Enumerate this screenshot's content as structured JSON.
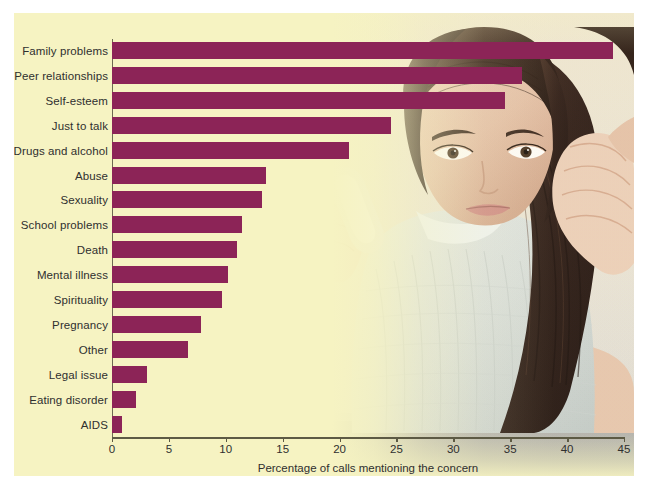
{
  "figure": {
    "background_color": "#f6f3c2",
    "border_color": "#ffffff",
    "bar_color": "#8c2457",
    "axis_color": "#5d5a44",
    "text_color": "#2f2f2f",
    "photo_alt": "young woman holding a mobile phone to her ear with her hand on her forehead"
  },
  "chart_data": {
    "type": "bar",
    "orientation": "horizontal",
    "title": "",
    "xlabel": "Percentage of calls mentioning the concern",
    "ylabel": "",
    "xlim": [
      0,
      45
    ],
    "xticks": [
      0,
      5,
      10,
      15,
      20,
      25,
      30,
      35,
      40,
      45
    ],
    "xtick_labels": [
      "0",
      "5",
      "10",
      "15",
      "20",
      "25",
      "30",
      "35",
      "40",
      "45"
    ],
    "grid": false,
    "legend": null,
    "categories": [
      "Family problems",
      "Peer relationships",
      "Self-esteem",
      "Just to talk",
      "Drugs and alcohol",
      "Abuse",
      "Sexuality",
      "School problems",
      "Death",
      "Mental illness",
      "Spirituality",
      "Pregnancy",
      "Other",
      "Legal issue",
      "Eating disorder",
      "AIDS"
    ],
    "values": [
      44,
      36,
      34.5,
      24.5,
      20.8,
      13.5,
      13.2,
      11.4,
      11,
      10.2,
      9.7,
      7.8,
      6.7,
      3.1,
      2.1,
      0.9
    ]
  }
}
